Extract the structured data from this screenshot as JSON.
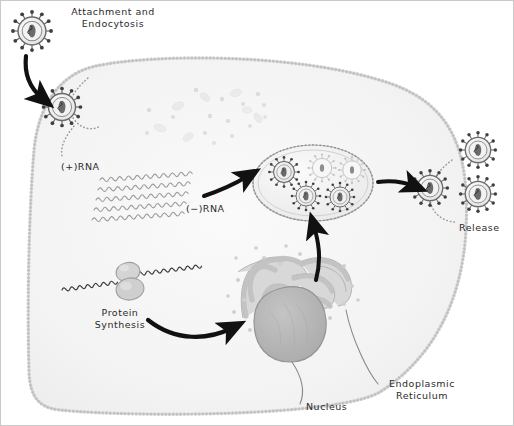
{
  "diagram": {
    "type": "biological-process-diagram",
    "background_color": "#ffffff",
    "border_color": "#bdbdbd"
  },
  "labels": {
    "attachment": "Attachment and\nEndocytosis",
    "plus_rna": "(+)RNA",
    "minus_rna": "(−)RNA",
    "release": "Release",
    "protein_synthesis": "Protein\nSynthesis",
    "nucleus": "Nucleus",
    "endoplasmic_reticulum": "Endoplasmic\nReticulum"
  },
  "structures": {
    "cell": {
      "name": "host-cell",
      "membrane_style": "beaded-phospholipid",
      "membrane_color": "#9a9a9a",
      "cytosol_color": "#f4f4f4"
    },
    "nucleus": {
      "name": "nucleus",
      "fill": "#b5b5b5",
      "stroke": "#8f8f8f"
    },
    "endoplasmic_reticulum": {
      "name": "endoplasmic-reticulum",
      "fill": "#d6d6d6",
      "stroke": "#b0b0b0",
      "ribosome_color": "#c9c9c9"
    },
    "assembly_vesicle": {
      "name": "assembly-vesicle",
      "fill": "#f0f0f0",
      "stroke": "#a8a8a8",
      "virions_inside": 5,
      "mature_virions": 3,
      "assembling_virions": 2
    },
    "ribosome": {
      "name": "ribosome",
      "fill": "#d0d0d0",
      "stroke": "#9c9c9c"
    }
  },
  "virions": {
    "color_envelope": "#efefef",
    "color_stroke": "#6f6f6f",
    "color_core": "#5a5a5a",
    "spike_color": "#4a4a4a",
    "outside_cell_count": 1,
    "entering_count": 1,
    "budding_count": 1,
    "released_count": 2
  },
  "rna": {
    "strand_color": "#9a9a9a",
    "plus_strand_count": 5,
    "mrna_color": "#3a3a3a"
  },
  "arrows": {
    "color": "#111111",
    "steps": [
      "entry-arrow",
      "rna-to-assembly-arrow",
      "er-to-assembly-arrow",
      "protein-to-er-arrow",
      "assembly-to-release-arrow"
    ]
  },
  "leader_lines": {
    "color": "#8a8a8a",
    "items": [
      "nucleus-leader",
      "er-leader"
    ]
  }
}
